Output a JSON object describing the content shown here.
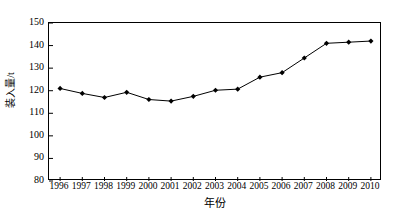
{
  "chart_data": {
    "type": "line",
    "title": "",
    "subtitle": "",
    "xlabel": "年份",
    "ylabel": "装入量/t",
    "x": [
      1996,
      1997,
      1998,
      1999,
      2000,
      2001,
      2002,
      2003,
      2004,
      2005,
      2006,
      2007,
      2008,
      2009,
      2010
    ],
    "categories": [
      "1996",
      "1997",
      "1998",
      "1999",
      "2000",
      "2001",
      "2002",
      "2003",
      "2004",
      "2005",
      "2006",
      "2007",
      "2008",
      "2009",
      "2010"
    ],
    "values": [
      121.0,
      118.8,
      117.0,
      119.3,
      116.1,
      115.4,
      117.5,
      120.2,
      120.7,
      126.0,
      128.0,
      134.5,
      141.0,
      141.5,
      142.0
    ],
    "series": [
      {
        "name": "装入量",
        "values": [
          121.0,
          118.8,
          117.0,
          119.3,
          116.1,
          115.4,
          117.5,
          120.2,
          120.7,
          126.0,
          128.0,
          134.5,
          141.0,
          141.5,
          142.0
        ],
        "color": "#000000",
        "marker": "diamond"
      }
    ],
    "xlim": [
      1995.5,
      2010.5
    ],
    "ylim": [
      80,
      150
    ],
    "yticks": [
      80,
      90,
      100,
      110,
      120,
      130,
      140,
      150
    ],
    "ytick_labels": [
      "80",
      "90",
      "100",
      "110",
      "120",
      "130",
      "140",
      "150"
    ],
    "xticks": [
      1996,
      1997,
      1998,
      1999,
      2000,
      2001,
      2002,
      2003,
      2004,
      2005,
      2006,
      2007,
      2008,
      2009,
      2010
    ],
    "xtick_labels": [
      "1996",
      "1997",
      "1998",
      "1999",
      "2000",
      "2001",
      "2002",
      "2003",
      "2004",
      "2005",
      "2006",
      "2007",
      "2008",
      "2009",
      "2010"
    ],
    "grid": false,
    "legend": null,
    "legend_position": "none",
    "annotations": [],
    "line_color": "#000000",
    "marker_color": "#000000",
    "background_color": "#ffffff",
    "axis_color": "#000000"
  }
}
